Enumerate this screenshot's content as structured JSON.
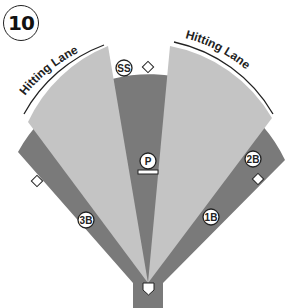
{
  "figure": {
    "number": "10",
    "lanes": [
      {
        "label": "Hitting Lane",
        "side": "left"
      },
      {
        "label": "Hitting Lane",
        "side": "right"
      }
    ],
    "positions": [
      {
        "label": "SS"
      },
      {
        "label": "P"
      },
      {
        "label": "3B"
      },
      {
        "label": "1B"
      },
      {
        "label": "2B"
      }
    ],
    "colors": {
      "dark_zone": "#7a7a7a",
      "light_zone": "#c4c4c4",
      "background": "#ffffff",
      "marker_fill": "#ffffff",
      "outline": "#222222"
    }
  }
}
